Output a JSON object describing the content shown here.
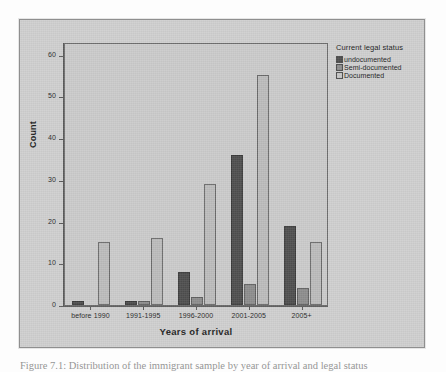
{
  "figure": {
    "caption": "Figure 7.1: Distribution of the immigrant sample by year of arrival and legal status"
  },
  "chart_data": {
    "type": "bar",
    "title": "",
    "xlabel": "Years of arrival",
    "ylabel": "Count",
    "categories": [
      "before 1990",
      "1991-1995",
      "1996-2000",
      "2001-2005",
      "2005+"
    ],
    "series": [
      {
        "name": "undocumented",
        "color": "#4e4e4e",
        "values": [
          1,
          1,
          8,
          36,
          19
        ]
      },
      {
        "name": "Semi-documented",
        "color": "#8d8d8d",
        "values": [
          0,
          1,
          2,
          5,
          4
        ]
      },
      {
        "name": "Documented",
        "color": "#bcbcbc",
        "values": [
          15,
          16,
          29,
          55,
          15
        ]
      }
    ],
    "ylim": [
      0,
      63
    ],
    "yticks": [
      0,
      10,
      20,
      30,
      40,
      50,
      60
    ],
    "ytick_labels": [
      "0",
      "10",
      "20",
      "30",
      "40",
      "50",
      "60"
    ],
    "grid": false,
    "legend": {
      "title": "Current legal status",
      "position": "right-outside",
      "entries": [
        "undocumented",
        "Semi-documented",
        "Documented"
      ]
    }
  },
  "colors": {
    "card_background": "#cfcfcf",
    "plot_background": "#cbcbcb",
    "axis": "#5a5a5a",
    "text": "#1e1e1e"
  }
}
